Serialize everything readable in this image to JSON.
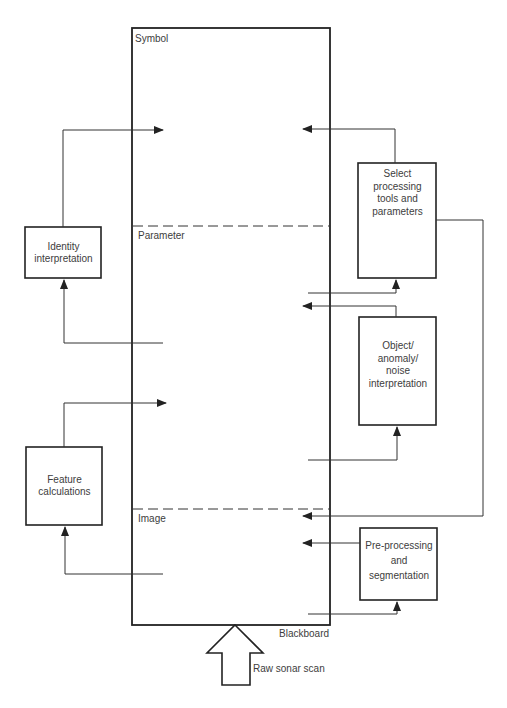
{
  "diagram": {
    "blackboard": {
      "label": "Blackboard",
      "levels": [
        {
          "name": "Symbol"
        },
        {
          "name": "Parameter"
        },
        {
          "name": "Image"
        }
      ]
    },
    "input": {
      "label": "Raw sonar scan"
    },
    "knowledge_sources": {
      "identity": {
        "lines": [
          "Identity",
          "interpretation"
        ]
      },
      "feature": {
        "lines": [
          "Feature",
          "calculations"
        ]
      },
      "select": {
        "lines": [
          "Select",
          "processing",
          "tools and",
          "parameters"
        ]
      },
      "object": {
        "lines": [
          "Object/",
          "anomaly/",
          "noise",
          "interpretation"
        ]
      },
      "preproc": {
        "lines": [
          "Pre-processing",
          "and",
          "segmentation"
        ]
      }
    },
    "connections": [
      {
        "from": "Parameter level",
        "to": "Identity interpretation"
      },
      {
        "from": "Identity interpretation",
        "to": "Symbol level"
      },
      {
        "from": "Image level",
        "to": "Feature calculations"
      },
      {
        "from": "Feature calculations",
        "to": "Parameter level"
      },
      {
        "from": "Select processing tools and parameters",
        "to": "Symbol level"
      },
      {
        "from": "Parameter level",
        "to": "Select processing tools and parameters"
      },
      {
        "from": "Object/anomaly/noise interpretation",
        "to": "Parameter level"
      },
      {
        "from": "Parameter level",
        "to": "Object/anomaly/noise interpretation"
      },
      {
        "from": "Select processing tools and parameters",
        "to": "Image level"
      },
      {
        "from": "Pre-processing and segmentation",
        "to": "Image level"
      },
      {
        "from": "Image level",
        "to": "Pre-processing and segmentation"
      },
      {
        "from": "Raw sonar scan",
        "to": "Blackboard"
      }
    ],
    "colors": {
      "line": "#2b2b2b",
      "text": "#3d3d3d",
      "background": "#ffffff"
    }
  }
}
